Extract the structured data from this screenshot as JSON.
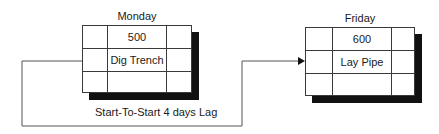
{
  "predecessor": {
    "day": "Monday",
    "id": "500",
    "name": "Dig Trench"
  },
  "successor": {
    "day": "Friday",
    "id": "600",
    "name": "Lay Pipe"
  },
  "relationship": {
    "label": "Start-To-Start 4 days Lag"
  },
  "colors": {
    "line": "#3a3a3a",
    "shadow": "#111111"
  }
}
